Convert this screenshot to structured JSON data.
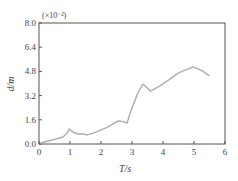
{
  "chart_data": {
    "type": "line",
    "title": "",
    "xlabel": "T/s",
    "ylabel": "d/m",
    "y_multiplier": "(×10⁻²)",
    "xlim": [
      0,
      6
    ],
    "ylim": [
      0,
      8.0
    ],
    "x_ticks": [
      "0",
      "1",
      "2",
      "3",
      "4",
      "5",
      "6"
    ],
    "y_ticks": [
      "0.0",
      "1.6",
      "3.2",
      "4.8",
      "6.4",
      "8.0"
    ],
    "grid": false,
    "legend": null,
    "series": [
      {
        "name": "d",
        "color": "#b0b0b0",
        "x": [
          0.05,
          0.3,
          0.5,
          0.77,
          0.9,
          0.97,
          1.1,
          1.26,
          1.4,
          1.55,
          1.75,
          2.0,
          2.2,
          2.4,
          2.55,
          2.7,
          2.84,
          3.0,
          3.19,
          3.35,
          3.6,
          3.9,
          4.2,
          4.5,
          4.97,
          5.25,
          5.5
        ],
        "y": [
          0.07,
          0.2,
          0.3,
          0.46,
          0.7,
          0.99,
          0.78,
          0.66,
          0.68,
          0.6,
          0.72,
          0.93,
          1.1,
          1.35,
          1.52,
          1.48,
          1.39,
          2.4,
          3.38,
          3.97,
          3.5,
          3.85,
          4.25,
          4.7,
          5.1,
          4.85,
          4.5
        ]
      }
    ]
  }
}
